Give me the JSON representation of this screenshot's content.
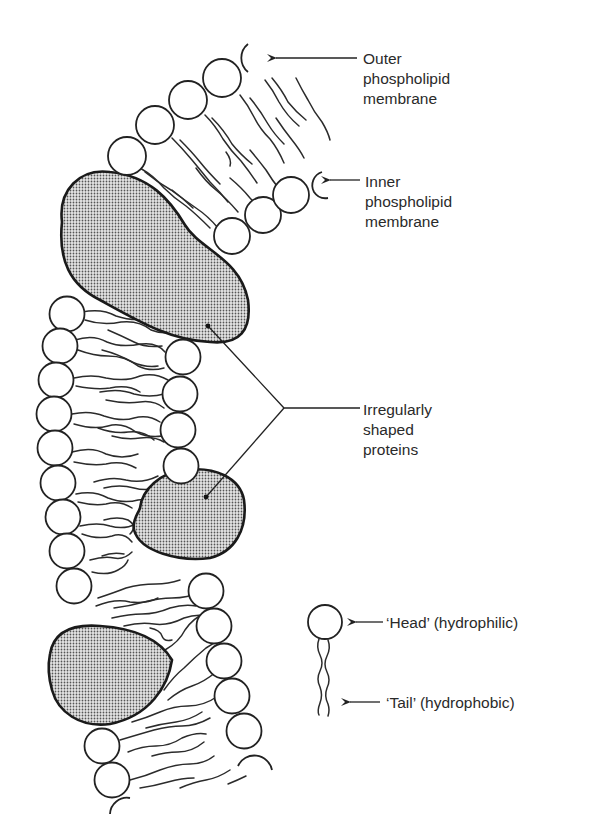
{
  "diagram": {
    "labels": {
      "outer_membrane": [
        "Outer",
        "phospholipid",
        "membrane"
      ],
      "inner_membrane": [
        "Inner",
        "phospholipid",
        "membrane"
      ],
      "proteins": [
        "Irregularly",
        "shaped",
        "proteins"
      ],
      "head": "‘Head’ (hydrophilic)",
      "tail": "‘Tail’ (hydrophobic)"
    },
    "colors": {
      "line": "#222222",
      "text": "#2a2a2a",
      "protein_fill": "#bdbdbd",
      "background": "#ffffff"
    },
    "legend_icon": "phospholipid-molecule-icon"
  }
}
